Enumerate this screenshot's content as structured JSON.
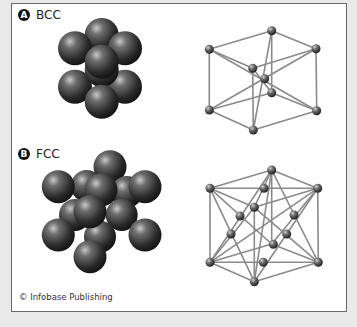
{
  "figure": {
    "panels": [
      {
        "id": "A",
        "badge": "A",
        "title": "BCC"
      },
      {
        "id": "B",
        "badge": "B",
        "title": "FCC"
      }
    ],
    "credit": "© Infobase Publishing"
  },
  "colors": {
    "background": "#e9e9e9",
    "frame_border": "#6a6a6a",
    "sphere_dark": "#1e1e1e",
    "sphere_light": "#9a9a9a",
    "lattice_line": "#8a8a8a"
  }
}
